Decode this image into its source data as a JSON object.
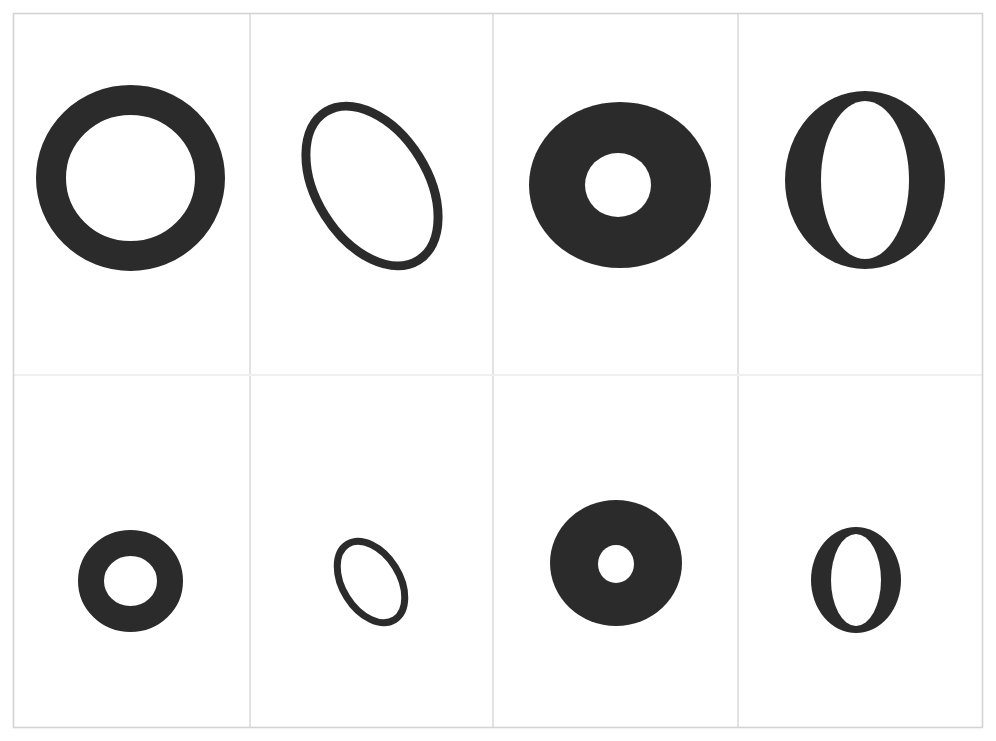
{
  "page": {
    "background_color": "#ffffff",
    "ink_color": "#2b2b2b",
    "border_color": "#d4d4d4",
    "divider_color": "#e2e2e2",
    "faint_divider_color": "#f0f0f0",
    "width": 996,
    "height": 741
  },
  "sheet": {
    "x": 13,
    "y": 13,
    "width": 970,
    "height": 715
  },
  "grid": {
    "rows": 2,
    "columns": 4,
    "column_divider_x": [
      250,
      493,
      738
    ],
    "row_divider_y": [
      375
    ]
  },
  "cells": [
    {
      "id": "r1c1",
      "row": 1,
      "column": 1,
      "name": "thick-ring-large",
      "shape": "ring",
      "cx": 130.5,
      "cy": 178,
      "rx": 94.5,
      "ry": 93,
      "stroke_width": 30,
      "rotation": 0
    },
    {
      "id": "r1c2",
      "row": 1,
      "column": 2,
      "name": "thin-tilted-ellipse-large",
      "shape": "ellipse-outline",
      "cx": 372,
      "cy": 186,
      "rx": 60,
      "ry": 92,
      "stroke_width": 9,
      "rotation": -32
    },
    {
      "id": "r1c3",
      "row": 1,
      "column": 3,
      "name": "annulus-small-hole-large",
      "shape": "annulus",
      "cx": 620,
      "cy": 185,
      "rx": 91,
      "ry": 83,
      "hole_rx": 33,
      "hole_ry": 32,
      "hole_cx": 618,
      "hole_cy": 185,
      "rotation": 0
    },
    {
      "id": "r1c4",
      "row": 1,
      "column": 4,
      "name": "typographic-letter-o-large",
      "shape": "letter-o",
      "cx": 865,
      "cy": 180,
      "rx": 80,
      "ry": 89,
      "hole_rx": 44,
      "hole_ry": 79,
      "rotation": 0
    },
    {
      "id": "r2c1",
      "row": 2,
      "column": 1,
      "name": "thick-ring-small",
      "shape": "ring",
      "cx": 130.5,
      "cy": 581,
      "rx": 52.5,
      "ry": 51,
      "stroke_width": 26,
      "rotation": 0
    },
    {
      "id": "r2c2",
      "row": 2,
      "column": 2,
      "name": "thin-tilted-ellipse-small",
      "shape": "ellipse-outline",
      "cx": 371,
      "cy": 582,
      "rx": 32,
      "ry": 48,
      "stroke_width": 7,
      "rotation": -32
    },
    {
      "id": "r2c3",
      "row": 2,
      "column": 3,
      "name": "annulus-small-hole-small",
      "shape": "annulus",
      "cx": 616,
      "cy": 563,
      "rx": 66,
      "ry": 63,
      "hole_rx": 18,
      "hole_ry": 19,
      "hole_cx": 616,
      "hole_cy": 564,
      "rotation": 0
    },
    {
      "id": "r2c4",
      "row": 2,
      "column": 4,
      "name": "typographic-letter-o-small",
      "shape": "letter-o",
      "cx": 856,
      "cy": 580,
      "rx": 45,
      "ry": 53,
      "hole_rx": 25,
      "hole_ry": 46,
      "rotation": 0
    }
  ]
}
